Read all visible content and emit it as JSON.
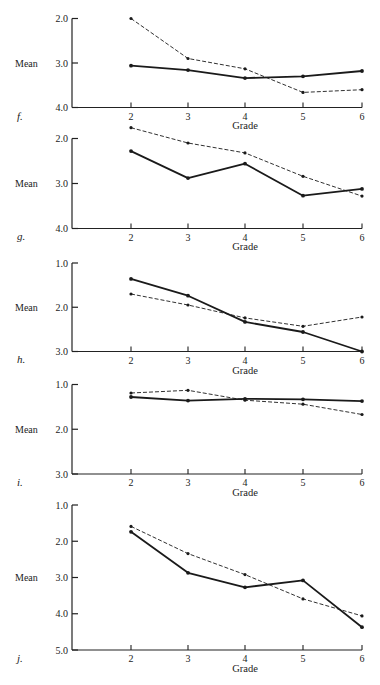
{
  "chart_data": [
    {
      "type": "line",
      "panel": "f.",
      "xlabel": "Grade",
      "ylabel": "Mean",
      "x": [
        2,
        3,
        4,
        5,
        6
      ],
      "yticks": [
        "2.0",
        "3.0",
        "4.0"
      ],
      "ylim": [
        2.0,
        4.0
      ],
      "y_inverted": true,
      "series": [
        {
          "name": "solid",
          "style": "solid",
          "values": [
            3.06,
            3.16,
            3.34,
            3.3,
            3.18
          ]
        },
        {
          "name": "dashed",
          "style": "dashed",
          "values": [
            2.0,
            2.9,
            3.13,
            3.66,
            3.6
          ]
        }
      ]
    },
    {
      "type": "line",
      "panel": "g.",
      "xlabel": "Grade",
      "ylabel": "Mean",
      "x": [
        2,
        3,
        4,
        5,
        6
      ],
      "yticks": [
        "2.0",
        "3.0",
        "4.0"
      ],
      "ylim": [
        2.0,
        4.0
      ],
      "y_inverted": true,
      "series": [
        {
          "name": "solid",
          "style": "solid",
          "values": [
            2.28,
            2.88,
            2.56,
            3.27,
            3.12
          ]
        },
        {
          "name": "dashed",
          "style": "dashed",
          "values": [
            1.76,
            2.1,
            2.32,
            2.84,
            3.28
          ]
        }
      ]
    },
    {
      "type": "line",
      "panel": "h.",
      "xlabel": "Grade",
      "ylabel": "Mean",
      "x": [
        2,
        3,
        4,
        5,
        6
      ],
      "yticks": [
        "1.0",
        "2.0",
        "3.0"
      ],
      "ylim": [
        1.0,
        3.0
      ],
      "y_inverted": true,
      "series": [
        {
          "name": "solid",
          "style": "solid",
          "values": [
            1.36,
            1.74,
            2.33,
            2.56,
            3.0
          ]
        },
        {
          "name": "dashed",
          "style": "dashed",
          "values": [
            1.7,
            1.95,
            2.24,
            2.43,
            2.22
          ]
        }
      ]
    },
    {
      "type": "line",
      "panel": "i.",
      "xlabel": "Grade",
      "ylabel": "Mean",
      "x": [
        2,
        3,
        4,
        5,
        6
      ],
      "yticks": [
        "1.0",
        "2.0",
        "3.0"
      ],
      "ylim": [
        1.0,
        3.0
      ],
      "y_inverted": true,
      "series": [
        {
          "name": "solid",
          "style": "solid",
          "values": [
            1.28,
            1.36,
            1.32,
            1.33,
            1.37
          ]
        },
        {
          "name": "dashed",
          "style": "dashed",
          "values": [
            1.19,
            1.13,
            1.35,
            1.44,
            1.67
          ]
        }
      ]
    },
    {
      "type": "line",
      "panel": "j.",
      "xlabel": "Grade",
      "ylabel": "Mean",
      "x": [
        2,
        3,
        4,
        5,
        6
      ],
      "yticks": [
        "1.0",
        "2.0",
        "3.0",
        "4.0",
        "5.0"
      ],
      "ylim": [
        1.0,
        5.0
      ],
      "y_inverted": true,
      "series": [
        {
          "name": "solid",
          "style": "solid",
          "values": [
            1.74,
            2.87,
            3.27,
            3.08,
            4.37
          ]
        },
        {
          "name": "dashed",
          "style": "dashed",
          "values": [
            1.59,
            2.34,
            2.92,
            3.59,
            4.06
          ]
        }
      ]
    }
  ],
  "layout": {
    "panels": [
      {
        "top": 18.5,
        "bottom": 107.5,
        "xlabel_y": 129,
        "panel_label_y": 120
      },
      {
        "top": 138.5,
        "bottom": 228.5,
        "xlabel_y": 250,
        "panel_label_y": 240
      },
      {
        "top": 263,
        "bottom": 351.5,
        "xlabel_y": 374,
        "panel_label_y": 363
      },
      {
        "top": 384.5,
        "bottom": 474,
        "xlabel_y": 496,
        "panel_label_y": 486
      },
      {
        "top": 505,
        "bottom": 650,
        "xlabel_y": 672,
        "panel_label_y": 662
      }
    ],
    "axis_x": 72,
    "x_positions": [
      131,
      188,
      245,
      303,
      362
    ]
  }
}
